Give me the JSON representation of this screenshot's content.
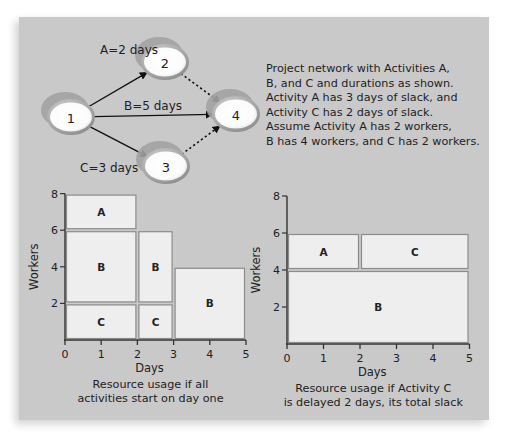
{
  "network": {
    "nodes": [
      {
        "id": "1",
        "label": "1"
      },
      {
        "id": "2",
        "label": "2"
      },
      {
        "id": "3",
        "label": "3"
      },
      {
        "id": "4",
        "label": "4"
      }
    ],
    "edges": [
      {
        "from": "1",
        "to": "2",
        "style": "solid",
        "label": "A=2 days"
      },
      {
        "from": "1",
        "to": "4",
        "style": "solid",
        "label": "B=5 days"
      },
      {
        "from": "1",
        "to": "3",
        "style": "solid",
        "label": "C=3 days"
      },
      {
        "from": "2",
        "to": "4",
        "style": "dotted",
        "label": ""
      },
      {
        "from": "3",
        "to": "4",
        "style": "dotted",
        "label": ""
      }
    ],
    "description_lines": [
      "Project network with Activities A,",
      "B, and C and durations as shown.",
      "Activity A has 3 days of slack, and",
      "Activity C has 2 days of slack.",
      "Assume Activity A has  2 workers,",
      "B has 4 workers, and C has 2 workers."
    ]
  },
  "colors": {
    "panel": "#c9c9c9",
    "block_fill": "#eeeeee",
    "block_stroke": "#8c8c8c",
    "axis": "#333333",
    "node_fill": "#ffffff",
    "node_ring": "#9a9a9a"
  },
  "chart_data": [
    {
      "type": "bar",
      "subtype": "resource-loading-blocks",
      "title": "",
      "caption_lines": [
        "Resource usage if all",
        "activities start on day one"
      ],
      "xlabel": "Days",
      "ylabel": "Workers",
      "xlim": [
        0,
        5
      ],
      "ylim": [
        0,
        8
      ],
      "xticks": [
        "0",
        "1",
        "2",
        "3",
        "4",
        "5"
      ],
      "yticks": [
        "2",
        "4",
        "6",
        "8"
      ],
      "grid": false,
      "blocks": [
        {
          "activity": "A",
          "x0": 0,
          "x1": 2,
          "y0": 6,
          "y1": 8
        },
        {
          "activity": "B",
          "x0": 0,
          "x1": 2,
          "y0": 2,
          "y1": 6
        },
        {
          "activity": "C",
          "x0": 0,
          "x1": 2,
          "y0": 0,
          "y1": 2
        },
        {
          "activity": "B",
          "x0": 2,
          "x1": 3,
          "y0": 2,
          "y1": 6
        },
        {
          "activity": "C",
          "x0": 2,
          "x1": 3,
          "y0": 0,
          "y1": 2
        },
        {
          "activity": "B",
          "x0": 3,
          "x1": 5,
          "y0": 0,
          "y1": 4
        }
      ]
    },
    {
      "type": "bar",
      "subtype": "resource-loading-blocks",
      "title": "",
      "caption_lines": [
        "Resource usage if Activity C",
        "is delayed 2 days, its total slack"
      ],
      "xlabel": "Days",
      "ylabel": "Workers",
      "xlim": [
        0,
        5
      ],
      "ylim": [
        0,
        8
      ],
      "xticks": [
        "0",
        "1",
        "2",
        "3",
        "4",
        "5"
      ],
      "yticks": [
        "2",
        "4",
        "6",
        "8"
      ],
      "grid": false,
      "blocks": [
        {
          "activity": "A",
          "x0": 0,
          "x1": 2,
          "y0": 4,
          "y1": 6
        },
        {
          "activity": "C",
          "x0": 2,
          "x1": 5,
          "y0": 4,
          "y1": 6
        },
        {
          "activity": "B",
          "x0": 0,
          "x1": 5,
          "y0": 0,
          "y1": 4
        }
      ]
    }
  ]
}
